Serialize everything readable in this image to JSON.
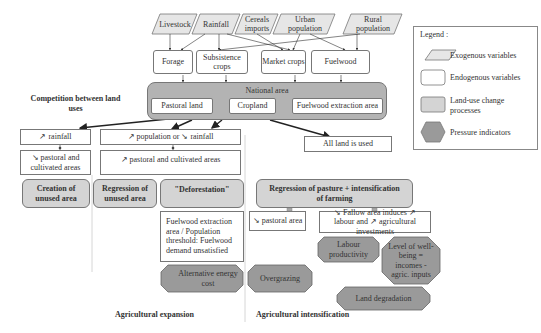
{
  "exogenous": [
    {
      "id": "livestock",
      "label": "Livestock"
    },
    {
      "id": "rainfall",
      "label": "Rainfall"
    },
    {
      "id": "cereals",
      "label": "Cereals imports"
    },
    {
      "id": "urban",
      "label": "Urban population"
    },
    {
      "id": "rural",
      "label": "Rural population"
    }
  ],
  "endogenous_top": [
    {
      "id": "forage",
      "label": "Forage"
    },
    {
      "id": "subsistence",
      "label": "Subsistence crops"
    },
    {
      "id": "market",
      "label": "Market crops"
    },
    {
      "id": "fuelwood",
      "label": "Fuelwood"
    }
  ],
  "national_area": {
    "title": "National area",
    "items": [
      "Pastoral land",
      "Cropland",
      "Fuelwood extraction area"
    ]
  },
  "competition_label": "Competition between land uses",
  "left_branch": {
    "cause": "↗ rainfall",
    "effect": "↘ pastoral and cultivated areas",
    "process": "Creation of unused area"
  },
  "middle_branch": {
    "cause": "↗ population or ↘ rainfall",
    "effect": "↗ pastoral and cultivated areas",
    "process_a": "Regression of unused area",
    "process_b": "\"Deforestation\"",
    "threshold": "Fuelwood extraction area / Population threshold: Fuelwood demand unsatisfied",
    "indicator": "Alternative energy cost"
  },
  "right_branch": {
    "cause": "All land is used",
    "process": "Regression of pasture + intensification of farming",
    "effect_a": "↘ pastoral area",
    "effect_b": "↘ Fallow area induces ↗ labour and ↗ agricultural investments",
    "indicators": [
      "Labour productivity",
      "Level of well-being = incomes - agric. inputs",
      "Overgrazing",
      "Land degradation"
    ]
  },
  "section_labels": {
    "expansion": "Agricultural expansion",
    "intensification": "Agricultural intensification"
  },
  "legend": {
    "title": "Legend :",
    "items": [
      {
        "shape": "parallelogram",
        "label": "Exogenous variables"
      },
      {
        "shape": "rounded-rect",
        "label": "Endogenous variables"
      },
      {
        "shape": "gray-rect",
        "label": "Land-use change processes"
      },
      {
        "shape": "hexagon",
        "label": "Pressure indicators"
      }
    ]
  },
  "colors": {
    "exogenous_fill": "#e6e6e6",
    "process_fill": "#d4d4d4",
    "national_fill": "#b3b3b3",
    "indicator_fill": "#9a9a9a",
    "stroke": "#777777"
  }
}
